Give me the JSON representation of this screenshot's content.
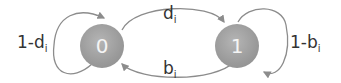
{
  "diagram": {
    "type": "two-state markov chain",
    "states": [
      {
        "id": "s0",
        "label": "0"
      },
      {
        "id": "s1",
        "label": "1"
      }
    ],
    "transitions": [
      {
        "from": "0",
        "to": "0",
        "label_main": "1-d",
        "label_sub": "i"
      },
      {
        "from": "0",
        "to": "1",
        "label_main": "d",
        "label_sub": "i"
      },
      {
        "from": "1",
        "to": "0",
        "label_main": "b",
        "label_sub": "i"
      },
      {
        "from": "1",
        "to": "1",
        "label_main": "1-b",
        "label_sub": "i"
      }
    ],
    "colors": {
      "node": "#9a9a9a",
      "edge": "#8c8c8c",
      "text": "#333333",
      "node_text": "#f4f4f4"
    }
  }
}
